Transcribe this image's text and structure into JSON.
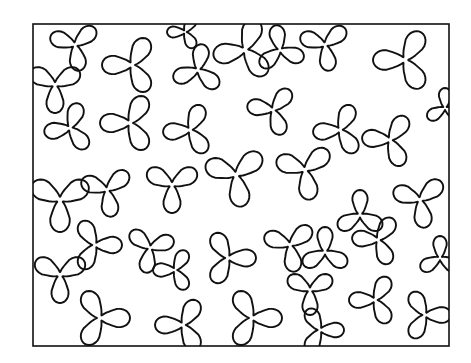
{
  "figure": {
    "width": 471,
    "height": 363,
    "background": "#ffffff",
    "stroke_color": "#111111",
    "stroke_width": 1.9,
    "frame": {
      "x": 33,
      "y": 24,
      "width": 416,
      "height": 322,
      "stroke_width": 1.6
    },
    "shapes": [
      {
        "cx": 75,
        "cy": 45,
        "r": 26,
        "rot": 200
      },
      {
        "cx": 132,
        "cy": 65,
        "r": 30,
        "rot": 180
      },
      {
        "cx": 185,
        "cy": 32,
        "r": 18,
        "rot": 180
      },
      {
        "cx": 198,
        "cy": 70,
        "r": 26,
        "rot": 160
      },
      {
        "cx": 245,
        "cy": 50,
        "r": 32,
        "rot": 170
      },
      {
        "cx": 280,
        "cy": 50,
        "r": 25,
        "rot": 20
      },
      {
        "cx": 325,
        "cy": 45,
        "r": 26,
        "rot": 200
      },
      {
        "cx": 405,
        "cy": 60,
        "r": 32,
        "rot": 180
      },
      {
        "cx": 55,
        "cy": 85,
        "r": 28,
        "rot": 90
      },
      {
        "cx": 70,
        "cy": 128,
        "r": 26,
        "rot": 170
      },
      {
        "cx": 130,
        "cy": 123,
        "r": 30,
        "rot": 180
      },
      {
        "cx": 190,
        "cy": 130,
        "r": 27,
        "rot": 175
      },
      {
        "cx": 273,
        "cy": 110,
        "r": 26,
        "rot": 190
      },
      {
        "cx": 340,
        "cy": 130,
        "r": 27,
        "rot": 175
      },
      {
        "cx": 390,
        "cy": 140,
        "r": 28,
        "rot": 185
      },
      {
        "cx": 445,
        "cy": 108,
        "r": 20,
        "rot": 270
      },
      {
        "cx": 60,
        "cy": 200,
        "r": 32,
        "rot": 90
      },
      {
        "cx": 107,
        "cy": 190,
        "r": 27,
        "rot": 80
      },
      {
        "cx": 172,
        "cy": 185,
        "r": 28,
        "rot": 90
      },
      {
        "cx": 236,
        "cy": 175,
        "r": 32,
        "rot": 80
      },
      {
        "cx": 305,
        "cy": 170,
        "r": 30,
        "rot": 80
      },
      {
        "cx": 360,
        "cy": 215,
        "r": 25,
        "rot": 30
      },
      {
        "cx": 420,
        "cy": 200,
        "r": 28,
        "rot": 200
      },
      {
        "cx": 95,
        "cy": 245,
        "r": 27,
        "rot": 0
      },
      {
        "cx": 150,
        "cy": 248,
        "r": 25,
        "rot": 100
      },
      {
        "cx": 175,
        "cy": 270,
        "r": 22,
        "rot": 180
      },
      {
        "cx": 228,
        "cy": 258,
        "r": 28,
        "rot": 0
      },
      {
        "cx": 290,
        "cy": 245,
        "r": 27,
        "rot": 80
      },
      {
        "cx": 325,
        "cy": 252,
        "r": 25,
        "rot": 30
      },
      {
        "cx": 378,
        "cy": 240,
        "r": 26,
        "rot": 185
      },
      {
        "cx": 440,
        "cy": 258,
        "r": 22,
        "rot": 270
      },
      {
        "cx": 60,
        "cy": 275,
        "r": 28,
        "rot": 90
      },
      {
        "cx": 100,
        "cy": 318,
        "r": 30,
        "rot": 0
      },
      {
        "cx": 183,
        "cy": 325,
        "r": 28,
        "rot": 180
      },
      {
        "cx": 252,
        "cy": 318,
        "r": 30,
        "rot": 0
      },
      {
        "cx": 310,
        "cy": 290,
        "r": 25,
        "rot": 90
      },
      {
        "cx": 320,
        "cy": 330,
        "r": 24,
        "rot": 0
      },
      {
        "cx": 375,
        "cy": 300,
        "r": 26,
        "rot": 180
      },
      {
        "cx": 425,
        "cy": 315,
        "r": 26,
        "rot": 0
      }
    ]
  }
}
